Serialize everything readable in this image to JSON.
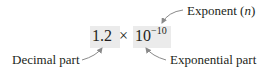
{
  "diagram": {
    "expression": {
      "decimal": "1.2",
      "times": "×",
      "base": "10",
      "exponent": "−10"
    },
    "labels": {
      "exponent": "Exponent (",
      "exponent_var": "n",
      "exponent_close": ")",
      "decimal": "Decimal part",
      "exponential": "Exponential part"
    },
    "colors": {
      "highlight_box": "#ebebeb",
      "arrow": "#8a8a8a",
      "text": "#231f20"
    }
  }
}
